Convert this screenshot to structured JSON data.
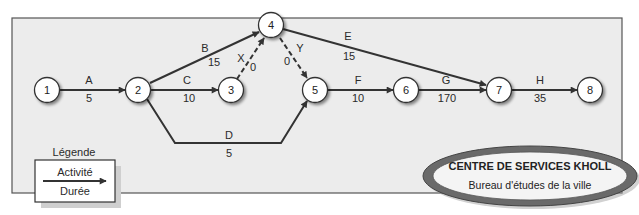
{
  "diagram": {
    "type": "activity-on-arrow network",
    "nodes": [
      {
        "id": "1",
        "label": "1"
      },
      {
        "id": "2",
        "label": "2"
      },
      {
        "id": "3",
        "label": "3"
      },
      {
        "id": "4",
        "label": "4"
      },
      {
        "id": "5",
        "label": "5"
      },
      {
        "id": "6",
        "label": "6"
      },
      {
        "id": "7",
        "label": "7"
      },
      {
        "id": "8",
        "label": "8"
      }
    ],
    "activities": [
      {
        "name": "A",
        "duration": "5",
        "from": "1",
        "to": "2",
        "dummy": false
      },
      {
        "name": "B",
        "duration": "15",
        "from": "2",
        "to": "4",
        "dummy": false
      },
      {
        "name": "C",
        "duration": "10",
        "from": "2",
        "to": "3",
        "dummy": false
      },
      {
        "name": "D",
        "duration": "5",
        "from": "2",
        "to": "5",
        "dummy": false
      },
      {
        "name": "X",
        "duration": "0",
        "from": "3",
        "to": "4",
        "dummy": true
      },
      {
        "name": "Y",
        "duration": "0",
        "from": "4",
        "to": "5",
        "dummy": true
      },
      {
        "name": "E",
        "duration": "15",
        "from": "4",
        "to": "7",
        "dummy": false
      },
      {
        "name": "F",
        "duration": "10",
        "from": "5",
        "to": "6",
        "dummy": false
      },
      {
        "name": "G",
        "duration": "170",
        "from": "6",
        "to": "7",
        "dummy": false
      },
      {
        "name": "H",
        "duration": "35",
        "from": "7",
        "to": "8",
        "dummy": false
      }
    ]
  },
  "legend": {
    "title": "Légende",
    "activity_label": "Activité",
    "duration_label": "Durée"
  },
  "title_badge": {
    "heading": "CENTRE DE SERVICES KHOLL",
    "subheading": "Bureau d'études de la ville"
  },
  "colors": {
    "frame_bg": "#ececec",
    "frame_border": "#555555",
    "line": "#333333",
    "node_fill": "#ffffff",
    "badge_ring": "#6a6a6a"
  }
}
